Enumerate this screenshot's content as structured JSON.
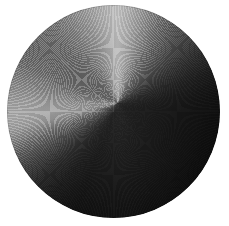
{
  "image": {
    "subject": "brushed-metal-disc",
    "description": "Circular brushed/spun metal disc with angular specular gradient on white background",
    "background_color": "#ffffff",
    "canvas": {
      "width": 229,
      "height": 226
    }
  },
  "disc": {
    "shape": "circle",
    "center_x": 113,
    "center_y": 111,
    "diameter": 213,
    "radius": 106,
    "bounds": {
      "left": 7,
      "top": 5,
      "right": 220,
      "bottom": 218
    },
    "finish": "spun/brushed metal with halftone print texture",
    "texture": "halftone-dither",
    "gradient_type": "conic",
    "tone_range": {
      "darkest": "#222222",
      "brightest": "#dcdcdc",
      "center": "#737373"
    },
    "highlights": [
      {
        "name": "primary-highlight",
        "clock_position": "12:00",
        "angle_deg": 0,
        "color": "#dcdcdc"
      },
      {
        "name": "secondary-highlight",
        "clock_position": "7:30",
        "angle_deg": 258,
        "color": "#bdbdbd"
      }
    ],
    "shadows": [
      {
        "name": "right-shadow",
        "clock_position": "3:00",
        "angle_deg": 110,
        "color": "#222222"
      },
      {
        "name": "bottom-shadow",
        "clock_position": "6:00",
        "angle_deg": 198,
        "color": "#262626"
      }
    ],
    "sample_points": [
      {
        "label": "top-center",
        "x": 113,
        "y": 14,
        "color": "#d8d8d8"
      },
      {
        "label": "upper-right",
        "x": 175,
        "y": 50,
        "color": "#2b2b2b"
      },
      {
        "label": "right-middle",
        "x": 180,
        "y": 110,
        "color": "#262626"
      },
      {
        "label": "bottom-center",
        "x": 113,
        "y": 206,
        "color": "#2a2a2a"
      },
      {
        "label": "lower-left",
        "x": 63,
        "y": 183,
        "color": "#b0b0b0"
      },
      {
        "label": "left-middle",
        "x": 30,
        "y": 112,
        "color": "#b6b6b6"
      },
      {
        "label": "center",
        "x": 113,
        "y": 112,
        "color": "#737373"
      }
    ]
  }
}
